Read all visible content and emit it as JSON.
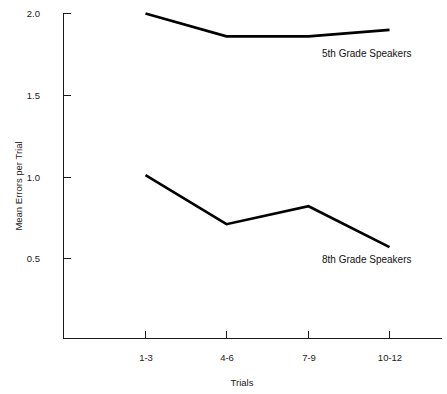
{
  "chart_data": {
    "type": "line",
    "title": "",
    "subtitle": "",
    "xlabel": "Trials",
    "ylabel": "Mean Errors per Trial",
    "categories": [
      "1-3",
      "4-6",
      "7-9",
      "10-12"
    ],
    "ylim": [
      0.0,
      2.0
    ],
    "yticks": [
      "0.5",
      "1.0",
      "1.5",
      "2.0"
    ],
    "ytick_values": [
      0.5,
      1.0,
      1.5,
      2.0
    ],
    "grid": false,
    "legend_position": "inline-annotation",
    "series": [
      {
        "name": "5th Grade Speakers",
        "values": [
          2.0,
          1.86,
          1.86,
          1.9
        ],
        "label": "5th Grade Speakers"
      },
      {
        "name": "8th Grade Speakers",
        "values": [
          1.01,
          0.71,
          0.82,
          0.57
        ],
        "label": "8th Grade Speakers"
      }
    ],
    "annotations": [
      {
        "text": "5th Grade Speakers",
        "x_px": 322,
        "y_px": 57
      },
      {
        "text": "8th Grade Speakers",
        "x_px": 322,
        "y_px": 263
      }
    ],
    "colors": {
      "line": "#000000",
      "axis": "#1a1a1a",
      "text": "#1a1a1a",
      "background": "#ffffff"
    }
  },
  "axes": {
    "y_tick_labels": [
      "2.0",
      "1.5",
      "1.0",
      "0.5"
    ],
    "x_tick_labels": [
      "1-3",
      "4-6",
      "7-9",
      "10-12"
    ],
    "y_axis_title": "Mean Errors per Trial",
    "x_axis_title": "Trials"
  }
}
